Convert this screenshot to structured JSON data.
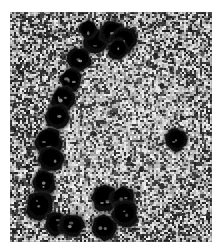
{
  "figure": {
    "kind": "electron-micrograph",
    "modality": "grayscale",
    "title": "",
    "caption": "",
    "width_px": 220,
    "height_px": 249,
    "margin": {
      "left": 10,
      "top": 12,
      "right": 8,
      "bottom": 7
    },
    "plate": {
      "x": 10,
      "y": 12,
      "width": 202,
      "height": 230
    },
    "colors": {
      "page_background": "#ffffff",
      "film_base": "#8d8d8d",
      "film_light": "#d9d9d9",
      "film_mid": "#9a9a9a",
      "film_dark": "#3a3a3a",
      "particle": "#0d0d0d",
      "particle_core": "#000000",
      "particle_highlight": "#b9b9b9",
      "interior_field": "#a8a8a8"
    },
    "background": {
      "description": "high-contrast salt-and-pepper granular film texture",
      "grain_cell_px": 2,
      "interior_is_lighter": true,
      "speck_count": 420
    },
    "arrangement": {
      "description": "open C-shaped arc / ring of dark circular particles, opening toward the right",
      "particle_count": 20
    },
    "particles": [
      {
        "id": "p01",
        "cx": 95,
        "cy": 42,
        "r": 13,
        "group": "top-cluster"
      },
      {
        "id": "p02",
        "cx": 112,
        "cy": 33,
        "r": 12,
        "group": "top-cluster"
      },
      {
        "id": "p03",
        "cx": 124,
        "cy": 40,
        "r": 13,
        "group": "top-cluster"
      },
      {
        "id": "p04",
        "cx": 118,
        "cy": 50,
        "r": 10,
        "group": "top-cluster"
      },
      {
        "id": "p05",
        "cx": 79,
        "cy": 60,
        "r": 12,
        "group": "upper-left-chain"
      },
      {
        "id": "p06",
        "cx": 71,
        "cy": 80,
        "r": 11,
        "group": "upper-left-chain"
      },
      {
        "id": "p07",
        "cx": 63,
        "cy": 99,
        "r": 12,
        "group": "left-chain"
      },
      {
        "id": "p08",
        "cx": 57,
        "cy": 117,
        "r": 12,
        "group": "left-chain"
      },
      {
        "id": "p09",
        "cx": 49,
        "cy": 142,
        "r": 13,
        "group": "left-chain"
      },
      {
        "id": "p10",
        "cx": 51,
        "cy": 160,
        "r": 12,
        "group": "left-chain"
      },
      {
        "id": "p11",
        "cx": 44,
        "cy": 183,
        "r": 12,
        "group": "lower-left-chain"
      },
      {
        "id": "p12",
        "cx": 40,
        "cy": 206,
        "r": 14,
        "group": "bottom-left-cluster"
      },
      {
        "id": "p13",
        "cx": 56,
        "cy": 224,
        "r": 12,
        "group": "bottom-left-cluster"
      },
      {
        "id": "p14",
        "cx": 72,
        "cy": 226,
        "r": 12,
        "group": "bottom-left-cluster"
      },
      {
        "id": "p15",
        "cx": 105,
        "cy": 198,
        "r": 13,
        "group": "bottom-right-cluster"
      },
      {
        "id": "p16",
        "cx": 123,
        "cy": 199,
        "r": 12,
        "group": "bottom-right-cluster"
      },
      {
        "id": "p17",
        "cx": 125,
        "cy": 214,
        "r": 13,
        "group": "bottom-right-cluster"
      },
      {
        "id": "p18",
        "cx": 104,
        "cy": 228,
        "r": 12,
        "group": "bottom-right-cluster"
      },
      {
        "id": "p19",
        "cx": 176,
        "cy": 140,
        "r": 11,
        "group": "isolated-right"
      },
      {
        "id": "p20",
        "cx": 88,
        "cy": 30,
        "r": 9,
        "group": "top-cluster"
      }
    ]
  }
}
